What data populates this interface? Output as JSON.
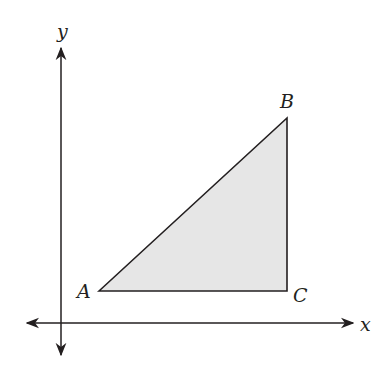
{
  "diagram": {
    "type": "coordinate-plane-triangle",
    "axes": {
      "x_label": "x",
      "y_label": "y"
    },
    "triangle": {
      "fill": "#e6e6e6",
      "stroke": "#231f20",
      "vertices": [
        {
          "name": "A",
          "label": "A"
        },
        {
          "name": "B",
          "label": "B"
        },
        {
          "name": "C",
          "label": "C"
        }
      ],
      "right_angle_at": "C"
    }
  }
}
